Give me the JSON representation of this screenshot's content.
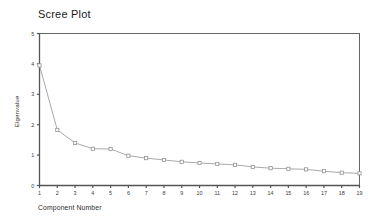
{
  "figure": {
    "title": "Scree Plot",
    "xlabel": "Component Number",
    "ylabel": "Eigenvalue"
  },
  "axis_colors": {
    "frame": "#555555",
    "series_line": "#9a9a9a",
    "marker_stroke": "#8c8c8c",
    "marker_fill": "#ffffff",
    "text": "#2b2b2b",
    "background": "#ffffff"
  },
  "chart_data": {
    "type": "line",
    "title": "Scree Plot",
    "xlabel": "Component Number",
    "ylabel": "Eigenvalue",
    "x": [
      1,
      2,
      3,
      4,
      5,
      6,
      7,
      8,
      9,
      10,
      11,
      12,
      13,
      14,
      15,
      16,
      17,
      18,
      19
    ],
    "values": [
      3.95,
      1.83,
      1.4,
      1.21,
      1.2,
      0.98,
      0.9,
      0.84,
      0.78,
      0.74,
      0.71,
      0.68,
      0.61,
      0.57,
      0.55,
      0.53,
      0.47,
      0.42,
      0.4
    ],
    "series": [
      {
        "name": "Eigenvalue",
        "values": [
          3.95,
          1.83,
          1.4,
          1.21,
          1.2,
          0.98,
          0.9,
          0.84,
          0.78,
          0.74,
          0.71,
          0.68,
          0.61,
          0.57,
          0.55,
          0.53,
          0.47,
          0.42,
          0.4
        ]
      }
    ],
    "xlim": [
      1,
      19
    ],
    "ylim": [
      0,
      5
    ],
    "ytick_labels": [
      "0",
      "1",
      "2",
      "3",
      "4",
      "5"
    ],
    "ytick_values": [
      0,
      1,
      2,
      3,
      4,
      5
    ],
    "xtick_labels": [
      "1",
      "2",
      "3",
      "4",
      "5",
      "6",
      "7",
      "8",
      "9",
      "10",
      "11",
      "12",
      "13",
      "14",
      "15",
      "16",
      "17",
      "18",
      "19"
    ],
    "xtick_values": [
      1,
      2,
      3,
      4,
      5,
      6,
      7,
      8,
      9,
      10,
      11,
      12,
      13,
      14,
      15,
      16,
      17,
      18,
      19
    ],
    "grid": false,
    "legend": null,
    "marker": "square-open"
  }
}
